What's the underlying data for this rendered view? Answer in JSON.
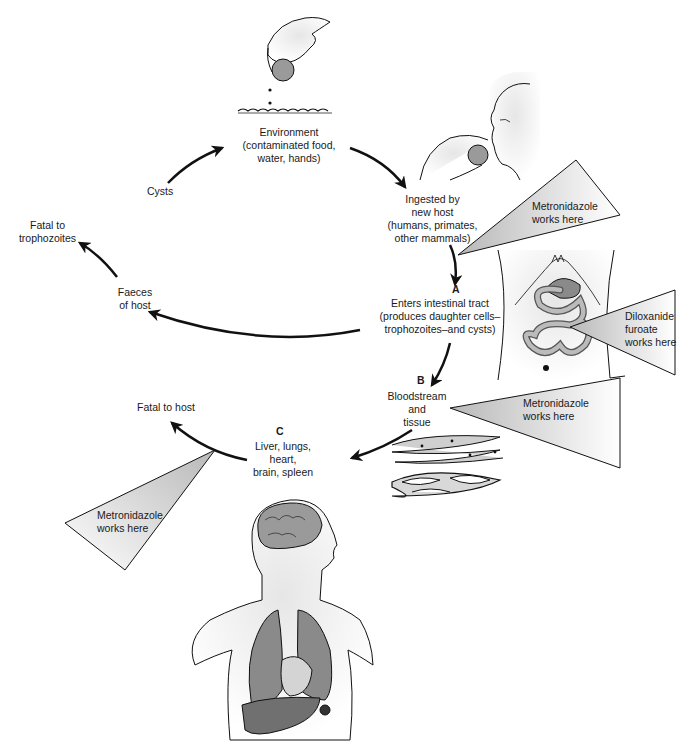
{
  "diagram": {
    "nodes": {
      "environment": "Environment\n(contaminated food,\nwater, hands)",
      "ingested": "Ingested by\nnew host\n(humans, primates,\nother mammals)",
      "intestinal_letter": "A",
      "intestinal": "Enters intestinal tract\n(produces daughter cells–\ntrophozoites–and cysts)",
      "bloodstream_letter": "B",
      "bloodstream": "Bloodstream\nand\ntissue",
      "organs_letter": "C",
      "organs": "Liver, lungs,\nheart,\nbrain, spleen",
      "fatal_host": "Fatal to host",
      "faeces": "Faeces\nof host",
      "fatal_troph": "Fatal to\ntrophozoites",
      "cysts": "Cysts"
    },
    "drugs": {
      "metronidazole_ingest": "Metronidazole\nworks here",
      "diloxanide": "Diloxanide\nfuroate\nworks here",
      "metronidazole_blood": "Metronidazole\nworks here",
      "metronidazole_organs": "Metronidazole\nworks here"
    },
    "colors": {
      "line": "#111111",
      "wedge_fill": "#d4d4d4",
      "organ_fill": "#8a8a8a",
      "skin_fill": "#eeeeee"
    }
  }
}
